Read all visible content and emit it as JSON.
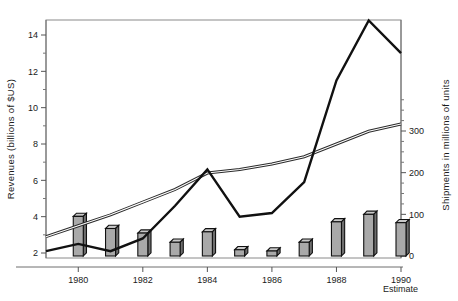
{
  "chart_data": {
    "type": "line",
    "title": "",
    "subtitle": "",
    "x": [
      1979,
      1980,
      1981,
      1982,
      1983,
      1984,
      1985,
      1986,
      1987,
      1988,
      1989,
      1990
    ],
    "xlabel": "",
    "xtick_labels": [
      "1980",
      "1982",
      "1984",
      "1986",
      "1988",
      "1990"
    ],
    "xticks": [
      1980,
      1982,
      1984,
      1986,
      1988,
      1990
    ],
    "xlim": [
      1979,
      1990
    ],
    "grid": false,
    "legend": "none",
    "estimate_note": "Estimate",
    "left_axis": {
      "label": "Revenues (billions of $US)",
      "ticks": [
        2,
        4,
        6,
        8,
        10,
        12,
        14
      ],
      "tick_labels": [
        "2",
        "4",
        "6",
        "8",
        "10",
        "12",
        "14"
      ],
      "lim": [
        1.8,
        15.6
      ],
      "minor_tick_step": 1
    },
    "right_axis": {
      "label": "Shipments in millions of units",
      "ticks": [
        0,
        100,
        200,
        300
      ],
      "tick_labels": [
        "0",
        "100",
        "200",
        "300"
      ],
      "lim": [
        0,
        375
      ],
      "minor_tick_step": 25
    },
    "series": [
      {
        "name": "revenues-thick-line",
        "style": "thick-solid",
        "axis": "left",
        "units": "billions of $US",
        "x": [
          1979,
          1980,
          1981,
          1982,
          1983,
          1984,
          1985,
          1986,
          1987,
          1988,
          1989,
          1990
        ],
        "values": [
          2.1,
          2.5,
          2.1,
          2.8,
          4.6,
          6.6,
          4.0,
          4.2,
          5.9,
          11.5,
          14.8,
          13.0
        ]
      },
      {
        "name": "revenues-thin-double-line",
        "style": "thin-double",
        "axis": "left",
        "units": "billions of $US",
        "x": [
          1979,
          1980,
          1981,
          1982,
          1983,
          1984,
          1985,
          1986,
          1987,
          1988,
          1989,
          1990
        ],
        "values": [
          2.9,
          3.5,
          4.1,
          4.8,
          5.5,
          6.4,
          6.6,
          6.9,
          7.3,
          8.0,
          8.7,
          9.1
        ]
      },
      {
        "name": "shipments-bars",
        "style": "3d-bar",
        "axis": "right",
        "units": "millions of units",
        "x": [
          1980,
          1981,
          1982,
          1983,
          1984,
          1985,
          1986,
          1987,
          1988,
          1989,
          1990
        ],
        "values": [
          95,
          66,
          55,
          33,
          58,
          15,
          12,
          33,
          82,
          100,
          80
        ]
      }
    ]
  },
  "colors": {
    "background": "#ffffff",
    "line_dark": "#111111",
    "bar_face": "#a9a9a9",
    "bar_top": "#c9c9c9",
    "bar_side": "#6e6e6e",
    "axis": "#6f6f6f"
  }
}
